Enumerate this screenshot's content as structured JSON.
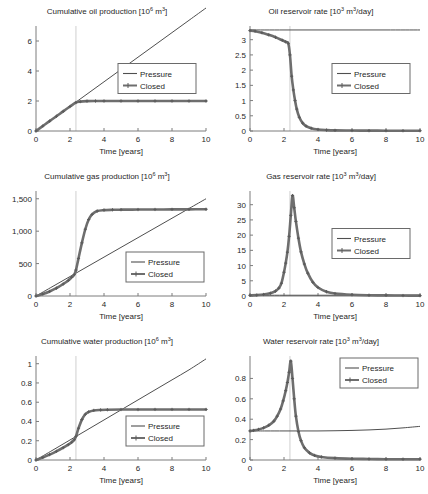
{
  "figure": {
    "axis_label_x": "Time [years]",
    "legend": {
      "pressure": "Pressure",
      "closed": "Closed"
    },
    "shutin_year": 2.35
  },
  "chart_data": [
    {
      "id": "cumulative-oil-production",
      "type": "line",
      "title": "Cumulative oil production [10⁶ m³]",
      "title_text": "Cumulative oil production [10",
      "title_sup": "6",
      "title_tail": " m",
      "title_sup2": "3",
      "title_end": "]",
      "xlabel": "Time [years]",
      "ylabel": "",
      "xlim": [
        0,
        10
      ],
      "ylim": [
        0,
        7
      ],
      "xticks": [
        0,
        2,
        4,
        6,
        8,
        10
      ],
      "yticks": [
        0,
        2,
        4,
        6
      ],
      "ytick_labels": [
        "0",
        "2",
        "4",
        "6"
      ],
      "grid": false,
      "legend_position": "center-right",
      "series": [
        {
          "name": "Pressure",
          "markers": false,
          "x": [
            0,
            1,
            2,
            3,
            4,
            5,
            6,
            7,
            8,
            9,
            10
          ],
          "values": [
            0,
            0.82,
            1.64,
            2.46,
            3.28,
            4.1,
            4.92,
            5.74,
            6.56,
            7.38,
            8.2
          ]
        },
        {
          "name": "Closed",
          "markers": true,
          "x": [
            0,
            0.4,
            0.8,
            1.2,
            1.6,
            2.0,
            2.35,
            2.6,
            3.0,
            3.5,
            4,
            5,
            6,
            7,
            8,
            9,
            10
          ],
          "values": [
            0,
            0.33,
            0.66,
            0.98,
            1.31,
            1.63,
            1.9,
            1.96,
            1.99,
            2.0,
            2.0,
            2.0,
            2.0,
            2.0,
            2.0,
            2.0,
            2.0
          ]
        }
      ]
    },
    {
      "id": "oil-reservoir-rate",
      "type": "line",
      "title": "Oil reservoir rate [10³ m³/day]",
      "title_text": "Oil reservoir rate [10",
      "title_sup": "3",
      "title_tail": " m",
      "title_sup2": "3",
      "title_end": "/day]",
      "xlabel": "Time [years]",
      "ylabel": "",
      "xlim": [
        0,
        10
      ],
      "ylim": [
        0,
        3.45
      ],
      "xticks": [
        0,
        2,
        4,
        6,
        8,
        10
      ],
      "yticks": [
        0,
        0.5,
        1,
        1.5,
        2,
        2.5,
        3
      ],
      "ytick_labels": [
        "0",
        "0.5",
        "1",
        "1.5",
        "2",
        "2.5",
        "3"
      ],
      "grid": false,
      "legend_position": "center-right",
      "series": [
        {
          "name": "Pressure",
          "markers": false,
          "x": [
            0,
            2,
            4,
            6,
            8,
            10
          ],
          "values": [
            3.32,
            3.32,
            3.32,
            3.32,
            3.32,
            3.32
          ]
        },
        {
          "name": "Closed",
          "markers": true,
          "x": [
            0,
            0.3,
            0.7,
            1.1,
            1.5,
            1.9,
            2.1,
            2.25,
            2.35,
            2.45,
            2.55,
            2.65,
            2.75,
            2.9,
            3.1,
            3.3,
            3.6,
            4,
            4.5,
            5,
            6,
            7,
            8,
            9,
            10
          ],
          "values": [
            3.3,
            3.28,
            3.23,
            3.16,
            3.08,
            2.98,
            2.93,
            2.88,
            2.5,
            1.8,
            1.35,
            1.0,
            0.72,
            0.45,
            0.26,
            0.16,
            0.09,
            0.05,
            0.03,
            0.02,
            0.015,
            0.012,
            0.01,
            0.01,
            0.01
          ]
        }
      ]
    },
    {
      "id": "cumulative-gas-production",
      "type": "line",
      "title": "Cumulative gas production [10⁶ m³]",
      "title_text": "Cumulative gas production [10",
      "title_sup": "6",
      "title_tail": " m",
      "title_sup2": "3",
      "title_end": "]",
      "xlabel": "Time [years]",
      "ylabel": "",
      "xlim": [
        0,
        10
      ],
      "ylim": [
        0,
        1620
      ],
      "xticks": [
        0,
        2,
        4,
        6,
        8,
        10
      ],
      "yticks": [
        0,
        500,
        1000,
        1500
      ],
      "ytick_labels": [
        "0",
        "500",
        "1,000",
        "1,500"
      ],
      "grid": false,
      "legend_position": "bottom-right",
      "series": [
        {
          "name": "Pressure",
          "markers": false,
          "x": [
            0,
            1,
            2,
            3,
            4,
            5,
            6,
            7,
            8,
            9,
            10
          ],
          "values": [
            0,
            150,
            300,
            450,
            600,
            750,
            900,
            1050,
            1200,
            1350,
            1500
          ]
        },
        {
          "name": "Closed",
          "markers": true,
          "x": [
            0,
            0.4,
            0.8,
            1.2,
            1.6,
            1.9,
            2.1,
            2.25,
            2.35,
            2.5,
            2.7,
            2.9,
            3.1,
            3.3,
            3.6,
            4,
            4.5,
            5,
            6,
            7,
            8,
            9,
            10
          ],
          "values": [
            0,
            30,
            70,
            120,
            185,
            240,
            290,
            330,
            400,
            580,
            820,
            1030,
            1180,
            1260,
            1310,
            1325,
            1330,
            1332,
            1334,
            1335,
            1336,
            1337,
            1338
          ]
        }
      ]
    },
    {
      "id": "gas-reservoir-rate",
      "type": "line",
      "title": "Gas reservoir rate [10³ m³/day]",
      "title_text": "Gas reservoir rate [10",
      "title_sup": "3",
      "title_tail": " m",
      "title_sup2": "3",
      "title_end": "/day]",
      "xlabel": "Time [years]",
      "ylabel": "",
      "xlim": [
        0,
        10
      ],
      "ylim": [
        0,
        34.5
      ],
      "xticks": [
        0,
        2,
        4,
        6,
        8,
        10
      ],
      "yticks": [
        0,
        5,
        10,
        15,
        20,
        25,
        30
      ],
      "ytick_labels": [
        "0",
        "5",
        "10",
        "15",
        "20",
        "25",
        "30"
      ],
      "grid": false,
      "legend_position": "center-right",
      "series": [
        {
          "name": "Pressure",
          "markers": false,
          "x": [
            0,
            2,
            4,
            6,
            8,
            10
          ],
          "values": [
            0.25,
            0.25,
            0.25,
            0.25,
            0.25,
            0.25
          ]
        },
        {
          "name": "Closed",
          "markers": true,
          "x": [
            0,
            0.4,
            0.8,
            1.2,
            1.5,
            1.7,
            1.85,
            2.0,
            2.1,
            2.2,
            2.3,
            2.4,
            2.5,
            2.6,
            2.7,
            2.85,
            3.0,
            3.2,
            3.4,
            3.7,
            4,
            4.5,
            5,
            6,
            7,
            8,
            9,
            10
          ],
          "values": [
            0.2,
            0.3,
            0.5,
            0.9,
            1.6,
            2.6,
            4.2,
            7.8,
            10.8,
            14.4,
            19.6,
            26.5,
            33.0,
            29.0,
            24.5,
            19.0,
            14.5,
            10.5,
            7.5,
            4.5,
            2.8,
            1.4,
            0.8,
            0.4,
            0.25,
            0.2,
            0.15,
            0.12
          ]
        }
      ]
    },
    {
      "id": "cumulative-water-production",
      "type": "line",
      "title": "Cumulative water production [10⁶ m³]",
      "title_text": "Cumulative water production [10",
      "title_sup": "6",
      "title_tail": " m",
      "title_sup2": "3",
      "title_end": "]",
      "xlabel": "Time [years]",
      "ylabel": "",
      "xlim": [
        0,
        10
      ],
      "ylim": [
        0,
        1.08
      ],
      "xticks": [
        0,
        2,
        4,
        6,
        8,
        10
      ],
      "yticks": [
        0,
        0.2,
        0.4,
        0.6,
        0.8,
        1
      ],
      "ytick_labels": [
        "0",
        "0.2",
        "0.4",
        "0.6",
        "0.8",
        "1"
      ],
      "grid": false,
      "legend_position": "bottom-right",
      "series": [
        {
          "name": "Pressure",
          "markers": false,
          "x": [
            0,
            1,
            2,
            3,
            4,
            5,
            6,
            7,
            8,
            9,
            10
          ],
          "values": [
            0,
            0.104,
            0.208,
            0.312,
            0.416,
            0.52,
            0.624,
            0.728,
            0.832,
            0.936,
            1.05
          ]
        },
        {
          "name": "Closed",
          "markers": true,
          "x": [
            0,
            0.4,
            0.8,
            1.2,
            1.6,
            1.9,
            2.1,
            2.25,
            2.35,
            2.5,
            2.7,
            2.9,
            3.1,
            3.4,
            3.8,
            4.2,
            5,
            6,
            7,
            8,
            9,
            10
          ],
          "values": [
            0,
            0.026,
            0.056,
            0.09,
            0.128,
            0.16,
            0.185,
            0.21,
            0.245,
            0.33,
            0.42,
            0.475,
            0.5,
            0.515,
            0.52,
            0.522,
            0.524,
            0.524,
            0.525,
            0.525,
            0.525,
            0.525
          ]
        }
      ]
    },
    {
      "id": "water-reservoir-rate",
      "type": "line",
      "title": "Water reservoir rate [10³ m³/day]",
      "title_text": "Water reservoir rate [10",
      "title_sup": "3",
      "title_tail": " m",
      "title_sup2": "3",
      "title_end": "/day]",
      "xlabel": "Time [years]",
      "ylabel": "",
      "xlim": [
        0,
        10
      ],
      "ylim": [
        0,
        1.02
      ],
      "xticks": [
        0,
        2,
        4,
        6,
        8,
        10
      ],
      "yticks": [
        0,
        0.2,
        0.4,
        0.6,
        0.8
      ],
      "ytick_labels": [
        "0",
        "0.2",
        "0.4",
        "0.6",
        "0.8"
      ],
      "grid": false,
      "legend_position": "top-right",
      "series": [
        {
          "name": "Pressure",
          "markers": false,
          "x": [
            0,
            0.5,
            1,
            2,
            3,
            4,
            5,
            6,
            7,
            8,
            9,
            10
          ],
          "values": [
            0.285,
            0.285,
            0.285,
            0.285,
            0.285,
            0.285,
            0.287,
            0.29,
            0.295,
            0.303,
            0.315,
            0.33
          ]
        },
        {
          "name": "Closed",
          "markers": true,
          "x": [
            0,
            0.2,
            0.5,
            0.8,
            1.1,
            1.4,
            1.6,
            1.8,
            1.95,
            2.1,
            2.2,
            2.3,
            2.4,
            2.5,
            2.6,
            2.7,
            2.85,
            3.0,
            3.2,
            3.5,
            3.8,
            4.2,
            5,
            6,
            7,
            8,
            9,
            10
          ],
          "values": [
            0.285,
            0.29,
            0.3,
            0.315,
            0.34,
            0.38,
            0.43,
            0.5,
            0.58,
            0.68,
            0.76,
            0.86,
            0.97,
            0.8,
            0.6,
            0.43,
            0.28,
            0.19,
            0.12,
            0.07,
            0.045,
            0.03,
            0.018,
            0.012,
            0.01,
            0.008,
            0.008,
            0.008
          ]
        }
      ]
    }
  ]
}
